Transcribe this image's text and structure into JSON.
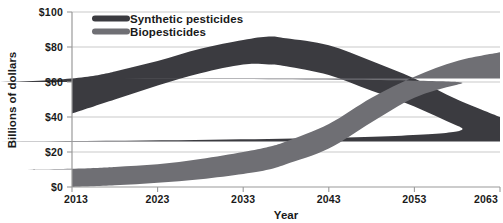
{
  "chart_data": {
    "type": "area",
    "title": "",
    "subtitle": "",
    "xlabel": "Year",
    "ylabel": "Billions of dollars",
    "xlim": [
      2013,
      2063
    ],
    "ylim": [
      0,
      100
    ],
    "grid": true,
    "legend_position": "top-left-inside",
    "x_tick_labels": [
      "2013",
      "2023",
      "2033",
      "2043",
      "2053",
      "2063"
    ],
    "x_ticks": [
      2013,
      2023,
      2033,
      2043,
      2053,
      2063
    ],
    "y_tick_labels": [
      "$0",
      "$20",
      "$40",
      "$60",
      "$80",
      "$100"
    ],
    "y_ticks": [
      0,
      20,
      40,
      60,
      80,
      100
    ],
    "x": [
      2013,
      2018,
      2023,
      2028,
      2033,
      2036,
      2038,
      2043,
      2048,
      2053,
      2058,
      2063
    ],
    "series": [
      {
        "name": "Synthetic pesticides",
        "color": "#3b3b40",
        "band": true,
        "upper": [
          60,
          66,
          72,
          79,
          84,
          86,
          85,
          81,
          72,
          62,
          50,
          40
        ],
        "lower": [
          42,
          50,
          58,
          65,
          70,
          70,
          69,
          64,
          55,
          46,
          35,
          26
        ],
        "values": [
          51,
          58,
          65,
          72,
          77,
          78,
          77,
          72.5,
          63.5,
          54,
          42.5,
          33
        ]
      },
      {
        "name": "Biopesticides",
        "color": "#6f6f74",
        "band": true,
        "upper": [
          10,
          11.5,
          13,
          16,
          20,
          23,
          26,
          36,
          51,
          63,
          72,
          77
        ],
        "lower": [
          0,
          1,
          2.5,
          4.5,
          7.5,
          10,
          13,
          22,
          37,
          51,
          58.5,
          62
        ],
        "values": [
          5,
          6.2,
          7.7,
          10.2,
          13.7,
          16.5,
          19.5,
          29,
          44,
          57,
          65.2,
          69.5
        ]
      }
    ],
    "legend": [
      {
        "label": "Synthetic pesticides",
        "color": "#3b3b40",
        "swatch": "thick-line"
      },
      {
        "label": "Biopesticides",
        "color": "#6f6f74",
        "swatch": "thick-line"
      }
    ]
  }
}
